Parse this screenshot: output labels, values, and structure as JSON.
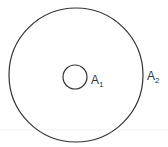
{
  "diagram": {
    "outer_circle": {
      "cx": 76,
      "cy": 75,
      "r": 67,
      "label": "A",
      "label_sub": "2"
    },
    "inner_circle": {
      "cx": 75,
      "cy": 77,
      "r": 12,
      "label": "A",
      "label_sub": "1"
    },
    "colors": {
      "stroke": "#333333",
      "background": "#ffffff",
      "band": "#f0f0f0"
    }
  }
}
